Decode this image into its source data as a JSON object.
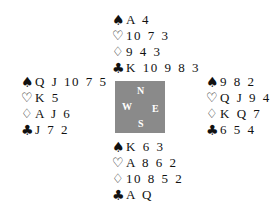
{
  "suits": {
    "spades": "♠",
    "hearts": "♡",
    "diamonds": "♢",
    "clubs": "♣"
  },
  "compass": {
    "north": "N",
    "south": "S",
    "east": "E",
    "west": "W",
    "background_color": "#8a8a8a"
  },
  "hands": {
    "north": {
      "spades": "A 4",
      "hearts": "10 7 3",
      "diamonds": "9 4 3",
      "clubs": "K 10 9 8 3"
    },
    "west": {
      "spades": "Q J 10 7 5",
      "hearts": "K 5",
      "diamonds": "A J 6",
      "clubs": "J 7 2"
    },
    "east": {
      "spades": "9 8 2",
      "hearts": "Q J 9 4",
      "diamonds": "K Q 7",
      "clubs": "6 5 4"
    },
    "south": {
      "spades": "K 6 3",
      "hearts": "A 8 6 2",
      "diamonds": "10 8 5 2",
      "clubs": "A Q"
    }
  }
}
